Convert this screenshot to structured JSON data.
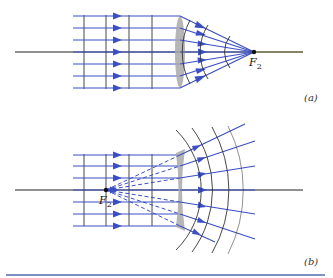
{
  "figure": {
    "panels": [
      {
        "id": "a",
        "label": "(a)",
        "description": "Converging lens: parallel rays focus to F2",
        "focal_label": "F",
        "focal_subscript": "2"
      },
      {
        "id": "b",
        "label": "(b)",
        "description": "Diverging lens: parallel rays diverge as if from F2",
        "focal_label": "F",
        "focal_subscript": "2"
      }
    ],
    "colors": {
      "ray": "#3b4fc4",
      "wavefront": "#333333",
      "axis": "#222222",
      "lens": "#a9a9a9",
      "rule": "#7f8fc8"
    }
  }
}
